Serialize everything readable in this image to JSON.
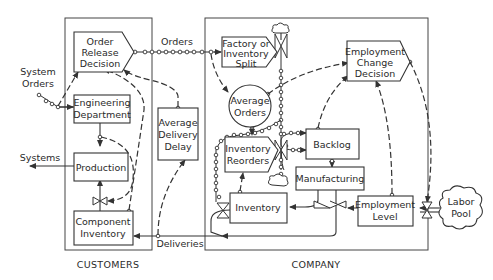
{
  "diagram": {
    "regions": {
      "customers": {
        "label": "CUSTOMERS"
      },
      "company": {
        "label": "COMPANY"
      }
    },
    "nodes": {
      "order_release_decision": {
        "lines": [
          "Order",
          "Release",
          "Decision"
        ],
        "type": "decision"
      },
      "engineering_department": {
        "lines": [
          "Engineering",
          "Department"
        ],
        "type": "level"
      },
      "production": {
        "lines": [
          "Production"
        ],
        "type": "level"
      },
      "component_inventory": {
        "lines": [
          "Component",
          "Inventory"
        ],
        "type": "level"
      },
      "average_delivery_delay": {
        "lines": [
          "Average",
          "Delivery",
          "Delay"
        ],
        "type": "auxiliary"
      },
      "factory_or_inventory_split": {
        "lines": [
          "Factory or",
          "Inventory",
          "Split"
        ],
        "type": "decision"
      },
      "average_orders": {
        "lines": [
          "Average",
          "Orders"
        ],
        "type": "auxiliary"
      },
      "employment_change_decision": {
        "lines": [
          "Employment",
          "Change",
          "Decision"
        ],
        "type": "decision"
      },
      "backlog": {
        "lines": [
          "Backlog"
        ],
        "type": "level"
      },
      "inventory_reorders": {
        "lines": [
          "Inventory",
          "Reorders"
        ],
        "type": "decision"
      },
      "manufacturing": {
        "lines": [
          "Manufacturing"
        ],
        "type": "level"
      },
      "inventory": {
        "lines": [
          "Inventory"
        ],
        "type": "level"
      },
      "employment_level": {
        "lines": [
          "Employment",
          "Level"
        ],
        "type": "level"
      },
      "labor_pool": {
        "lines": [
          "Labor",
          "Pool"
        ],
        "type": "source"
      }
    },
    "flow_labels": {
      "system_orders": [
        "System",
        "Orders"
      ],
      "orders": "Orders",
      "systems": "Systems",
      "deliveries": "Deliveries"
    },
    "legend": {
      "solid_line": "material flow",
      "dashed_line": "information flow",
      "beaded_line": "order flow"
    }
  }
}
